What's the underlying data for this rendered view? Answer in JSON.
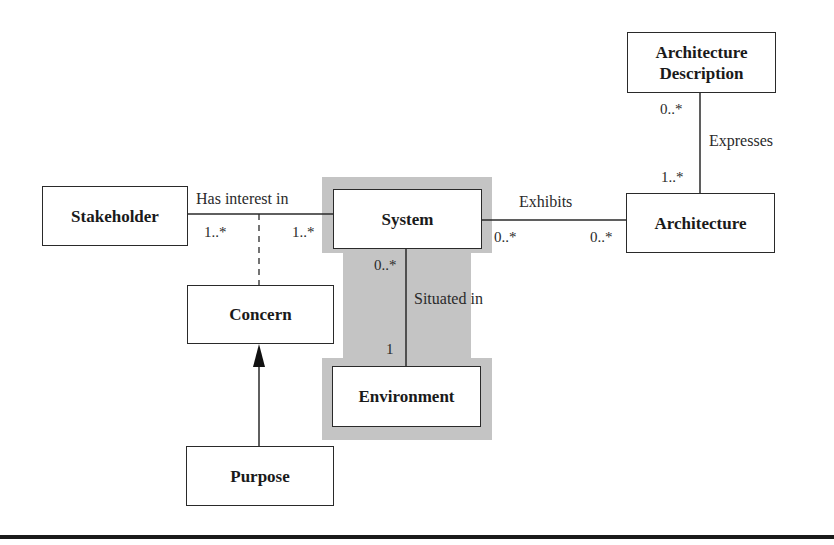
{
  "diagram": {
    "type": "UML class/association diagram",
    "highlight_color": "#c4c4c4",
    "classes": [
      {
        "id": "stakeholder",
        "label": "Stakeholder"
      },
      {
        "id": "system",
        "label": "System"
      },
      {
        "id": "architecture",
        "label": "Architecture"
      },
      {
        "id": "architecture_description",
        "label": "Architecture Description"
      },
      {
        "id": "concern",
        "label": "Concern"
      },
      {
        "id": "environment",
        "label": "Environment"
      },
      {
        "id": "purpose",
        "label": "Purpose"
      }
    ],
    "associations": [
      {
        "id": "has_interest_in",
        "label": "Has interest in",
        "from": "stakeholder",
        "to": "system",
        "from_mult": "1..*",
        "to_mult": "1..*"
      },
      {
        "id": "exhibits",
        "label": "Exhibits",
        "from": "system",
        "to": "architecture",
        "from_mult": "0..*",
        "to_mult": "0..*"
      },
      {
        "id": "expresses",
        "label": "Expresses",
        "from": "architecture_description",
        "to": "architecture",
        "from_mult": "0..*",
        "to_mult": "1..*"
      },
      {
        "id": "situated_in",
        "label": "Situated in",
        "from": "system",
        "to": "environment",
        "from_mult": "0..*",
        "to_mult": "1"
      }
    ],
    "association_class": {
      "class": "concern",
      "attached_to": "has_interest_in",
      "style": "dashed"
    },
    "dependencies": [
      {
        "from": "purpose",
        "to": "concern",
        "style": "solid arrow"
      }
    ]
  },
  "labels": {
    "stakeholder": "Stakeholder",
    "system": "System",
    "architecture": "Architecture",
    "architecture_description_line1": "Architecture",
    "architecture_description_line2": "Description",
    "concern": "Concern",
    "environment": "Environment",
    "purpose": "Purpose",
    "has_interest_in": "Has interest in",
    "exhibits": "Exhibits",
    "expresses": "Expresses",
    "situated_in": "Situated in"
  },
  "multiplicities": {
    "stakeholder_side": "1..*",
    "system_side_interest": "1..*",
    "system_side_exhibits": "0..*",
    "architecture_side_exhibits": "0..*",
    "ad_side_expresses": "0..*",
    "architecture_side_expresses": "1..*",
    "system_side_situated": "0..*",
    "environment_side_situated": "1"
  }
}
